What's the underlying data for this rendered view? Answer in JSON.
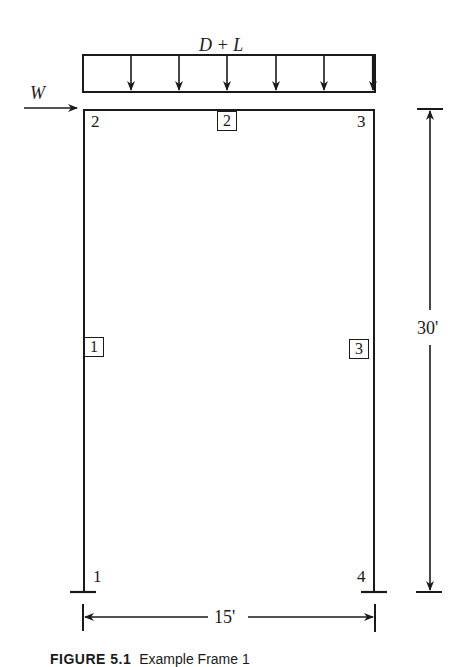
{
  "figure": {
    "load_label": "D + L",
    "wind_label": "W",
    "nodes": [
      {
        "id": "1",
        "label": "1"
      },
      {
        "id": "2",
        "label": "2"
      },
      {
        "id": "3",
        "label": "3"
      },
      {
        "id": "4",
        "label": "4"
      }
    ],
    "members": [
      {
        "id": "1",
        "label": "1"
      },
      {
        "id": "2",
        "label": "2"
      },
      {
        "id": "3",
        "label": "3"
      }
    ],
    "dimensions": {
      "height": "30'",
      "width": "15'"
    },
    "caption": {
      "number": "FIGURE 5.1",
      "text": "Example Frame 1"
    },
    "colors": {
      "line": "#1a1a1a",
      "background": "#ffffff"
    }
  }
}
